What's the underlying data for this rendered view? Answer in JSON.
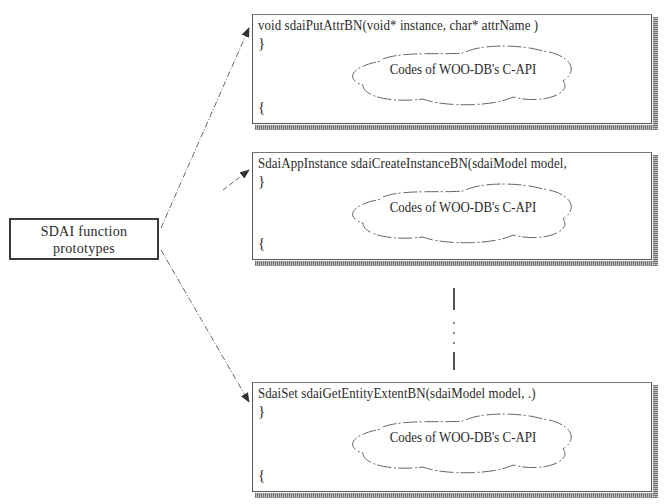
{
  "diagram": {
    "source_node": {
      "line1": "SDAI function",
      "line2": "prototypes"
    },
    "function_boxes": [
      {
        "signature": "void sdaiPutAttrBN(void* instance, char* attrName      )",
        "open_brace": "}",
        "close_brace": "{",
        "cloud_label": "Codes of WOO-DB's C-API"
      },
      {
        "signature": "SdaiAppInstance sdaiCreateInstanceBN(sdaiModel model,",
        "open_brace": "}",
        "close_brace": "{",
        "cloud_label": "Codes of WOO-DB's C-API"
      },
      {
        "signature": "SdaiSet sdaiGetEntityExtentBN(sdaiModel model,      .)",
        "open_brace": "}",
        "close_brace": "{",
        "cloud_label": "Codes of WOO-DB's C-API"
      }
    ],
    "continuation": "vertical ellipsis (more functions)",
    "colors": {
      "line": "#555555",
      "text": "#2a2a2a",
      "background": "#ffffff"
    }
  }
}
